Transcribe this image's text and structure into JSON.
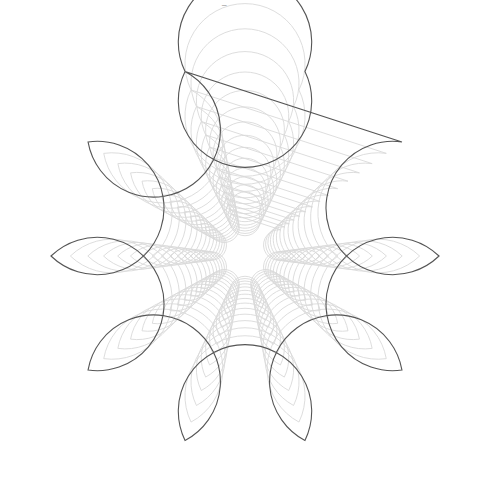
{
  "figure": {
    "width": 488,
    "height": 497,
    "center": [
      245,
      256
    ],
    "lobes": 10,
    "lobe_tip_angle_deg": 90,
    "outer_lobe_tip_radius": 222,
    "outer_ring_radius": 155.3,
    "outer_lobe_circle_radius": 66.7,
    "levels": 15,
    "scale_per_level": 0.9,
    "colors": {
      "outer_stroke": "#555555",
      "inner_stroke": "#d9d9d9",
      "background": "#ffffff"
    },
    "stroke_widths": {
      "outer": 1.1,
      "inner": 0.9
    }
  },
  "top_fragments": [
    {
      "text": "‾",
      "x": 186
    },
    {
      "text": "_",
      "x": 222
    }
  ]
}
